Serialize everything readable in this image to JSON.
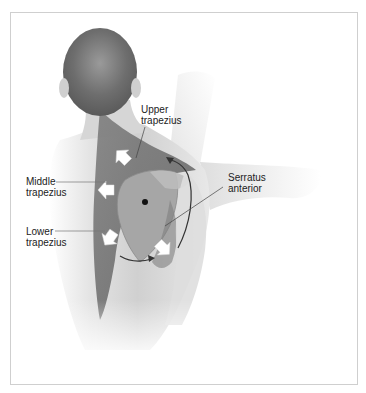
{
  "figure": {
    "labels": {
      "upper_trapezius": [
        "Upper",
        "trapezius"
      ],
      "middle_trapezius": [
        "Middle",
        "trapezius"
      ],
      "lower_trapezius": [
        "Lower",
        "trapezius"
      ],
      "serratus_anterior": [
        "Serratus",
        "anterior"
      ]
    },
    "colors": {
      "skin_light": "#e6e6e6",
      "skin_mid": "#c8c8c8",
      "muscle": "#8a8a8a",
      "muscle_dark": "#5e5e5e",
      "hair": "#6a6a6a",
      "scapula": "#a9a9a9",
      "arrow_fill": "#ffffff",
      "leader_line": "#444444",
      "frame_border": "#cfcfcf"
    },
    "caption": ""
  }
}
